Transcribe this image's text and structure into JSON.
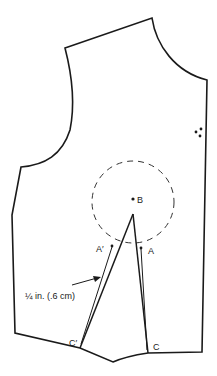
{
  "diagram": {
    "type": "bodice-pattern-dart-manipulation",
    "labels": {
      "B": "B",
      "A": "A",
      "A_prime": "A′",
      "C": "C",
      "C_prime": "C′",
      "measurement": "¼ in. (.6 cm)"
    },
    "colors": {
      "line": "#1a1a1a",
      "background": "#ffffff"
    }
  }
}
